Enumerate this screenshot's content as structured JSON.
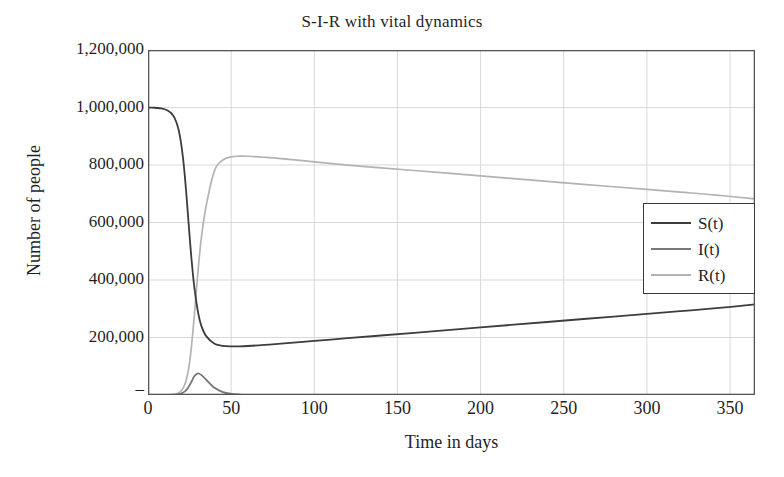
{
  "chart_data": {
    "type": "line",
    "title": "S-I-R with vital dynamics",
    "xlabel": "Time in days",
    "ylabel": "Number of people",
    "xlim": [
      0,
      365
    ],
    "ylim": [
      0,
      1200000
    ],
    "grid": true,
    "legend_position": "right",
    "xticks": [
      0,
      50,
      100,
      150,
      200,
      250,
      300,
      350
    ],
    "xtick_labels": [
      "0",
      "50",
      "100",
      "150",
      "200",
      "250",
      "300",
      "350"
    ],
    "yticks": [
      0,
      200000,
      400000,
      600000,
      800000,
      1000000,
      1200000
    ],
    "ytick_labels": [
      "–",
      "200,000",
      "400,000",
      "600,000",
      "800,000",
      "1,000,000",
      "1,200,000"
    ],
    "colors": {
      "S": "#3d3d3d",
      "I": "#777777",
      "R": "#b3b3b3",
      "grid": "#d9d9d9",
      "frame": "#555555"
    },
    "x": [
      0,
      2,
      4,
      6,
      8,
      10,
      12,
      14,
      15,
      16,
      17,
      18,
      19,
      20,
      21,
      22,
      23,
      24,
      25,
      26,
      27,
      28,
      30,
      32,
      35,
      40,
      45,
      50,
      55,
      60,
      70,
      80,
      100,
      120,
      140,
      160,
      180,
      200,
      220,
      240,
      260,
      280,
      300,
      320,
      340,
      365
    ],
    "series": [
      {
        "name": "S(t)",
        "label": "S(t)",
        "color": "#3d3d3d",
        "values": [
          1000000,
          999700,
          999200,
          998300,
          996700,
          993900,
          988900,
          980100,
          972800,
          963000,
          949500,
          931000,
          905900,
          872000,
          827300,
          770800,
          703500,
          629200,
          553600,
          482700,
          420600,
          368600,
          291000,
          242300,
          204700,
          178400,
          170800,
          168900,
          169200,
          170400,
          174200,
          178800,
          188200,
          197600,
          207000,
          216400,
          225800,
          235200,
          244600,
          254000,
          263400,
          272800,
          282200,
          291600,
          301000,
          315000
        ]
      },
      {
        "name": "I(t)",
        "label": "I(t)",
        "color": "#777777",
        "values": [
          1,
          2,
          5,
          12,
          29,
          69,
          166,
          396,
          611,
          941,
          1447,
          2221,
          3399,
          5174,
          7813,
          11664,
          17114,
          24479,
          33849,
          44812,
          56274,
          66201,
          74876,
          70104,
          53019,
          24936,
          10290,
          4077,
          1591,
          617,
          94,
          15,
          1,
          0,
          0,
          0,
          0,
          0,
          0,
          0,
          0,
          0,
          0,
          0,
          0,
          0
        ]
      },
      {
        "name": "R(t)",
        "label": "R(t)",
        "color": "#b3b3b3",
        "values": [
          0,
          5,
          13,
          33,
          80,
          193,
          464,
          1113,
          1723,
          2665,
          4118,
          6350,
          9776,
          15009,
          22942,
          34836,
          52419,
          77842,
          113700,
          161500,
          220500,
          285800,
          425800,
          542700,
          658600,
          780400,
          817400,
          828500,
          830600,
          830400,
          827000,
          822400,
          811000,
          799600,
          790200,
          780800,
          771400,
          762000,
          752600,
          743200,
          733800,
          724400,
          715000,
          705600,
          696200,
          682000
        ]
      }
    ]
  }
}
